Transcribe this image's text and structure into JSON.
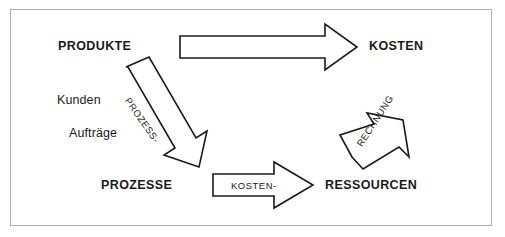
{
  "figure": {
    "type": "cycle-diagram",
    "border_color": "#b0b0b0",
    "background_color": "#ffffff",
    "stroke_color": "#1a1a1a",
    "text_color": "#1a1a1a"
  },
  "nodes": [
    {
      "id": "produkte",
      "label": "PRODUKTE",
      "style": "bold",
      "position": "top-left"
    },
    {
      "id": "kosten",
      "label": "KOSTEN",
      "style": "bold",
      "position": "top-right"
    },
    {
      "id": "prozesse",
      "label": "PROZESSE",
      "style": "bold",
      "position": "bottom-left"
    },
    {
      "id": "ressourcen",
      "label": "RESSOURCEN",
      "style": "bold",
      "position": "bottom-right"
    }
  ],
  "annotations": [
    {
      "id": "kunden",
      "label": "Kunden",
      "style": "plain"
    },
    {
      "id": "auftraege",
      "label": "Aufträge",
      "style": "plain"
    }
  ],
  "edges": [
    {
      "id": "produkte-kosten",
      "label": "",
      "from": "produkte",
      "to": "kosten",
      "direction": "right",
      "filled": false
    },
    {
      "id": "produkte-prozesse",
      "label": "PROZESS-",
      "from": "produkte",
      "to": "prozesse",
      "direction": "down-right",
      "filled": false
    },
    {
      "id": "prozesse-ressourcen",
      "label": "KOSTEN-",
      "from": "prozesse",
      "to": "ressourcen",
      "direction": "right",
      "filled": false
    },
    {
      "id": "ressourcen-kosten",
      "label": "RECHNUNG",
      "from": "ressourcen",
      "to": "kosten",
      "direction": "up-right",
      "filled": false
    }
  ]
}
